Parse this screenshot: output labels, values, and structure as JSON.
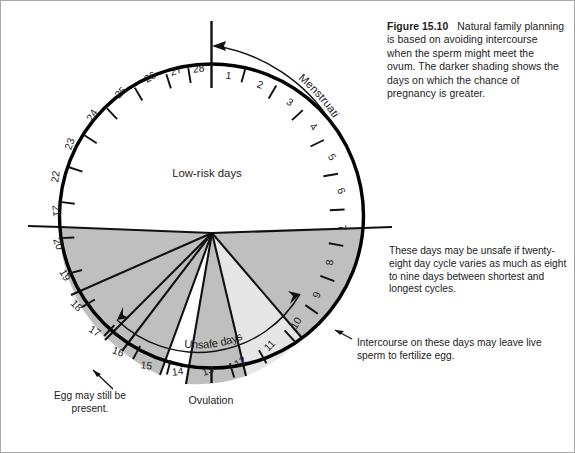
{
  "figure": {
    "label": "Figure 15.10",
    "caption": "Natural family planning is based on avoiding intercourse when the sperm might meet the ovum. The darker shading shows the days on which the chance of pregnancy is greater."
  },
  "diagram": {
    "title_inner_low_risk": "Low-risk days",
    "unsafe_days_label": "Unsafe days",
    "menstruation_label": "Menstruation",
    "ovulation_label": "Ovulation",
    "day_numbers": [
      "1",
      "2",
      "3",
      "4",
      "5",
      "6",
      "7",
      "8",
      "9",
      "10",
      "11",
      "12",
      "13",
      "14",
      "15",
      "16",
      "17",
      "18",
      "19",
      "20",
      "21",
      "22",
      "23",
      "24",
      "25",
      "26",
      "27",
      "28"
    ],
    "cycle_days_total": 28
  },
  "annotations": {
    "right_unsafe": "These days may be unsafe if twenty-eight day cycle varies as much as eight to nine days between shortest and longest cycles.",
    "right_intercourse": "Intercourse on these days may leave live sperm to fertilize egg.",
    "left_egg": "Egg may still be present."
  },
  "colors": {
    "outline": "#000000",
    "dark_shade": "#bfbfbf",
    "light_shade": "#e6e6e6",
    "white": "#ffffff",
    "text": "#1c1c1c",
    "border": "#9a9a9a"
  }
}
